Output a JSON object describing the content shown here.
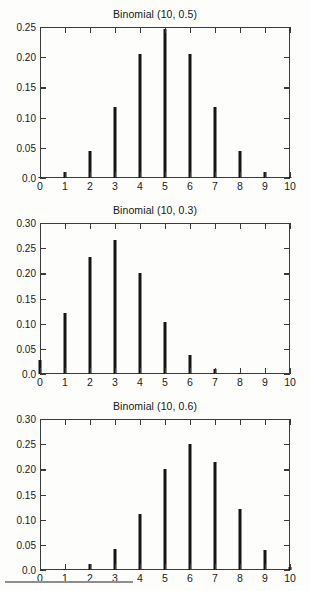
{
  "figure": {
    "kind": "stem-plot-grid",
    "panel_count": 3,
    "background_color": "#fdfdfc",
    "bar_color": "#151515",
    "axis_color": "#3b3b3b",
    "scan_artifact_rule": true
  },
  "chart_data": [
    {
      "type": "bar",
      "title": "Binomial (10, 0.5)",
      "xlabel": "",
      "ylabel": "",
      "categories": [
        "0",
        "1",
        "2",
        "3",
        "4",
        "5",
        "6",
        "7",
        "8",
        "9",
        "10"
      ],
      "x": [
        0,
        1,
        2,
        3,
        4,
        5,
        6,
        7,
        8,
        9,
        10
      ],
      "values": [
        0.001,
        0.01,
        0.044,
        0.117,
        0.205,
        0.246,
        0.205,
        0.117,
        0.044,
        0.01,
        0.001
      ],
      "xlim": [
        0,
        10
      ],
      "ylim": [
        0,
        0.25
      ],
      "ytick_labels": [
        "0.0",
        "0.05",
        "0.10",
        "0.15",
        "0.20",
        "0.25"
      ],
      "ytick_values": [
        0,
        0.05,
        0.1,
        0.15,
        0.2,
        0.25
      ],
      "xtick_labels": [
        "0",
        "1",
        "2",
        "3",
        "4",
        "5",
        "6",
        "7",
        "8",
        "9",
        "10"
      ],
      "grid": false,
      "legend": null
    },
    {
      "type": "bar",
      "title": "Binomial (10, 0.3)",
      "xlabel": "",
      "ylabel": "",
      "categories": [
        "0",
        "1",
        "2",
        "3",
        "4",
        "5",
        "6",
        "7",
        "8",
        "9",
        "10"
      ],
      "x": [
        0,
        1,
        2,
        3,
        4,
        5,
        6,
        7,
        8,
        9,
        10
      ],
      "values": [
        0.028,
        0.121,
        0.233,
        0.267,
        0.2,
        0.103,
        0.037,
        0.009,
        0.001,
        0.0,
        0.0
      ],
      "xlim": [
        0,
        10
      ],
      "ylim": [
        0,
        0.3
      ],
      "ytick_labels": [
        "0.0",
        "0.05",
        "0.10",
        "0.15",
        "0.20",
        "0.25",
        "0.30"
      ],
      "ytick_values": [
        0,
        0.05,
        0.1,
        0.15,
        0.2,
        0.25,
        0.3
      ],
      "xtick_labels": [
        "0",
        "1",
        "2",
        "3",
        "4",
        "5",
        "6",
        "7",
        "8",
        "9",
        "10"
      ],
      "grid": false,
      "legend": null
    },
    {
      "type": "bar",
      "title": "Binomial (10, 0.6)",
      "xlabel": "",
      "ylabel": "",
      "categories": [
        "0",
        "1",
        "2",
        "3",
        "4",
        "5",
        "6",
        "7",
        "8",
        "9",
        "10"
      ],
      "x": [
        0,
        1,
        2,
        3,
        4,
        5,
        6,
        7,
        8,
        9,
        10
      ],
      "values": [
        0.0,
        0.002,
        0.011,
        0.042,
        0.111,
        0.201,
        0.251,
        0.215,
        0.121,
        0.04,
        0.006
      ],
      "xlim": [
        0,
        10
      ],
      "ylim": [
        0,
        0.3
      ],
      "ytick_labels": [
        "0.0",
        "0.05",
        "0.10",
        "0.15",
        "0.20",
        "0.25",
        "0.30"
      ],
      "ytick_values": [
        0,
        0.05,
        0.1,
        0.15,
        0.2,
        0.25,
        0.3
      ],
      "xtick_labels": [
        "0",
        "1",
        "2",
        "3",
        "4",
        "5",
        "6",
        "7",
        "8",
        "9",
        "10"
      ],
      "grid": false,
      "legend": null
    }
  ]
}
